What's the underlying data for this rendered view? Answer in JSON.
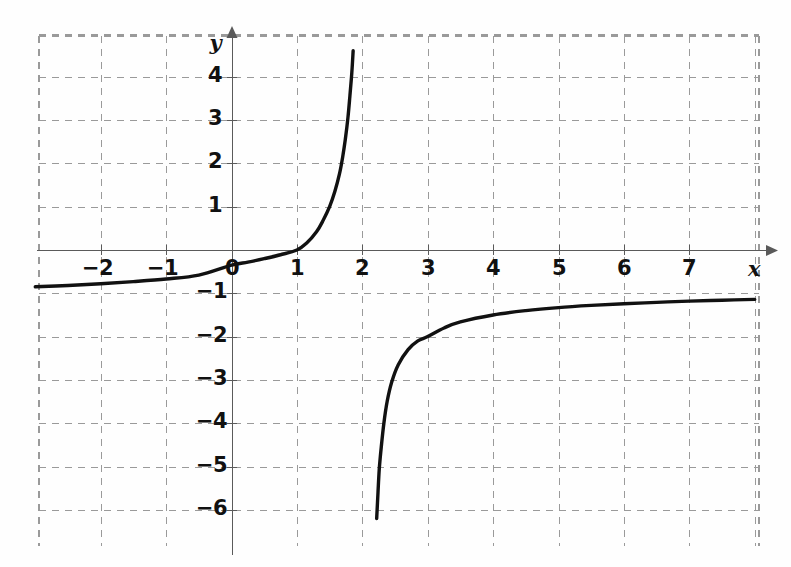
{
  "chart_data": {
    "type": "line",
    "title": "",
    "subtitle": "",
    "xlabel": "x",
    "ylabel": "y",
    "xlim": [
      -3.0,
      8.1
    ],
    "ylim": [
      -6.7,
      5.1
    ],
    "x_ticks": [
      -2,
      -1,
      0,
      1,
      2,
      3,
      4,
      5,
      6,
      7
    ],
    "x_tick_labels": [
      "−2",
      "−1",
      "0",
      "1",
      "2",
      "3",
      "4",
      "5",
      "6",
      "7"
    ],
    "y_ticks": [
      4,
      3,
      2,
      1,
      -1,
      -2,
      -3,
      -4,
      -5,
      -6
    ],
    "y_tick_labels": [
      "4",
      "3",
      "2",
      "1",
      "−1",
      "−2",
      "−3",
      "−4",
      "−5",
      "−6"
    ],
    "grid": true,
    "grid_style": "dashed",
    "grid_color": "#9a9a9a",
    "axis_color": "#5a5a5a",
    "curve_color": "#111111",
    "legend": [],
    "annotations": [],
    "asymptotes": {
      "vertical_x": 1.95,
      "horizontal_y": -1.0
    },
    "series": [
      {
        "name": "branch-left",
        "description": "Lower-left hyperbola branch rising from y = -1 asymptote through the root at x = 1 up toward the vertical asymptote",
        "points": [
          [
            -3.0,
            -0.85
          ],
          [
            -2.5,
            -0.82
          ],
          [
            -2.0,
            -0.78
          ],
          [
            -1.5,
            -0.73
          ],
          [
            -1.0,
            -0.67
          ],
          [
            -0.5,
            -0.58
          ],
          [
            0.0,
            -0.35
          ],
          [
            0.25,
            -0.28
          ],
          [
            0.5,
            -0.2
          ],
          [
            0.75,
            -0.11
          ],
          [
            1.0,
            0.0
          ],
          [
            1.15,
            0.16
          ],
          [
            1.3,
            0.42
          ],
          [
            1.4,
            0.68
          ],
          [
            1.5,
            1.0
          ],
          [
            1.58,
            1.35
          ],
          [
            1.65,
            1.75
          ],
          [
            1.7,
            2.15
          ],
          [
            1.74,
            2.55
          ],
          [
            1.78,
            3.05
          ],
          [
            1.81,
            3.55
          ],
          [
            1.84,
            4.1
          ],
          [
            1.86,
            4.6
          ]
        ]
      },
      {
        "name": "branch-right",
        "description": "Upper-right hyperbola branch rising from below toward the horizontal asymptote y = -1",
        "points": [
          [
            2.22,
            -6.2
          ],
          [
            2.24,
            -5.6
          ],
          [
            2.26,
            -5.05
          ],
          [
            2.29,
            -4.55
          ],
          [
            2.33,
            -4.0
          ],
          [
            2.38,
            -3.5
          ],
          [
            2.45,
            -3.05
          ],
          [
            2.55,
            -2.65
          ],
          [
            2.7,
            -2.3
          ],
          [
            2.85,
            -2.1
          ],
          [
            3.0,
            -2.0
          ],
          [
            3.25,
            -1.8
          ],
          [
            3.5,
            -1.66
          ],
          [
            4.0,
            -1.5
          ],
          [
            4.5,
            -1.4
          ],
          [
            5.0,
            -1.33
          ],
          [
            5.5,
            -1.28
          ],
          [
            6.0,
            -1.24
          ],
          [
            6.5,
            -1.21
          ],
          [
            7.0,
            -1.18
          ],
          [
            7.5,
            -1.16
          ],
          [
            8.0,
            -1.14
          ]
        ]
      }
    ]
  },
  "axes": {
    "x_axis_name": "x",
    "y_axis_name": "y"
  }
}
